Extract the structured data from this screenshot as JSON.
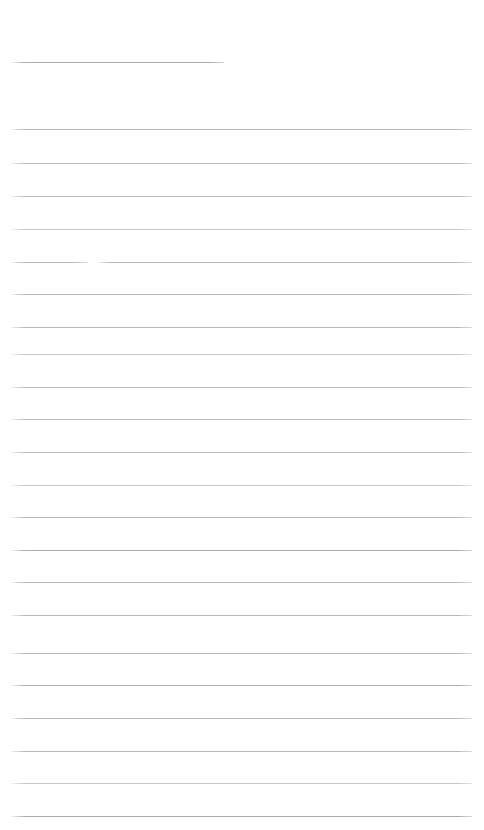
{
  "document": {
    "kind": "scanned-ruled-page",
    "title": "Blank ruled notepad page",
    "page_width": 484,
    "page_height": 830,
    "background_color": "#ffffff",
    "rule_color": "#b0b2b4",
    "rule_color_faint": "#c2c4c6",
    "rule_color_dark": "#a3a6a8",
    "rule_thickness": 1,
    "left_margin": 11,
    "right_margin": 472,
    "line_spacing": 32.7,
    "line_count": 23,
    "text_content": "",
    "notes": "No text, headings, or handwriting is visible; page is empty except for the printed rule lines."
  },
  "lines": [
    {
      "id": "rule-1",
      "y": 62,
      "x1": 11,
      "x2": 224,
      "tone": "dark",
      "segment_gap": null
    },
    {
      "id": "rule-2",
      "y": 129,
      "x1": 11,
      "x2": 472,
      "tone": "normal",
      "segment_gap": null
    },
    {
      "id": "rule-3",
      "y": 163,
      "x1": 11,
      "x2": 472,
      "tone": "normal",
      "segment_gap": null
    },
    {
      "id": "rule-4",
      "y": 196,
      "x1": 11,
      "x2": 472,
      "tone": "normal",
      "segment_gap": null
    },
    {
      "id": "rule-5",
      "y": 229,
      "x1": 11,
      "x2": 472,
      "tone": "faint",
      "segment_gap": null
    },
    {
      "id": "rule-6",
      "y": 262,
      "x1": 11,
      "x2": 472,
      "tone": "normal",
      "segment_gap": [
        88,
        97
      ]
    },
    {
      "id": "rule-7",
      "y": 294,
      "x1": 11,
      "x2": 472,
      "tone": "normal",
      "segment_gap": null
    },
    {
      "id": "rule-8",
      "y": 327,
      "x1": 11,
      "x2": 472,
      "tone": "normal",
      "segment_gap": null
    },
    {
      "id": "rule-9",
      "y": 354,
      "x1": 11,
      "x2": 472,
      "tone": "faint",
      "segment_gap": null
    },
    {
      "id": "rule-10",
      "y": 387,
      "x1": 11,
      "x2": 472,
      "tone": "normal",
      "segment_gap": null
    },
    {
      "id": "rule-11",
      "y": 419,
      "x1": 11,
      "x2": 472,
      "tone": "normal",
      "segment_gap": null
    },
    {
      "id": "rule-12",
      "y": 452,
      "x1": 11,
      "x2": 472,
      "tone": "normal",
      "segment_gap": null
    },
    {
      "id": "rule-13",
      "y": 485,
      "x1": 11,
      "x2": 472,
      "tone": "faint",
      "segment_gap": null
    },
    {
      "id": "rule-14",
      "y": 517,
      "x1": 11,
      "x2": 472,
      "tone": "normal",
      "segment_gap": null
    },
    {
      "id": "rule-15",
      "y": 550,
      "x1": 11,
      "x2": 472,
      "tone": "dark",
      "segment_gap": null
    },
    {
      "id": "rule-16",
      "y": 582,
      "x1": 11,
      "x2": 472,
      "tone": "normal",
      "segment_gap": null
    },
    {
      "id": "rule-17",
      "y": 615,
      "x1": 11,
      "x2": 472,
      "tone": "normal",
      "segment_gap": null
    },
    {
      "id": "rule-18",
      "y": 653,
      "x1": 11,
      "x2": 472,
      "tone": "normal",
      "segment_gap": null
    },
    {
      "id": "rule-19",
      "y": 685,
      "x1": 11,
      "x2": 472,
      "tone": "dark",
      "segment_gap": null
    },
    {
      "id": "rule-20",
      "y": 718,
      "x1": 11,
      "x2": 472,
      "tone": "normal",
      "segment_gap": null
    },
    {
      "id": "rule-21",
      "y": 751,
      "x1": 11,
      "x2": 472,
      "tone": "normal",
      "segment_gap": null
    },
    {
      "id": "rule-22",
      "y": 783,
      "x1": 11,
      "x2": 472,
      "tone": "faint",
      "segment_gap": null
    },
    {
      "id": "rule-23",
      "y": 816,
      "x1": 11,
      "x2": 472,
      "tone": "dark",
      "segment_gap": null
    }
  ]
}
